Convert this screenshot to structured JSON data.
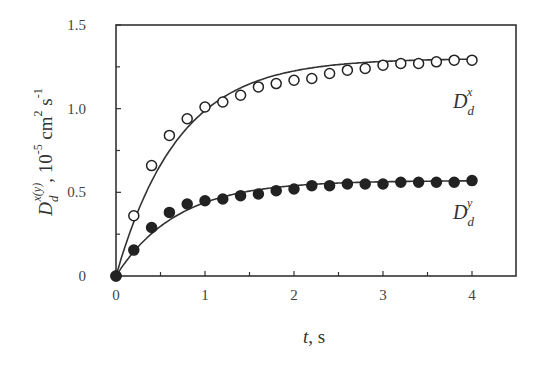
{
  "chart_data": {
    "type": "scatter",
    "title": "",
    "xlabel": "t, s",
    "ylabel": "D_d^{x(y)}, 10^{-5} cm^2 s^{-1}",
    "xlim": [
      0,
      4.5
    ],
    "ylim": [
      0,
      1.5
    ],
    "x_ticks": [
      0,
      1,
      2,
      3,
      4
    ],
    "x_minor_ticks": [
      0.5,
      1.5,
      2.5,
      3.5
    ],
    "y_ticks": [
      0,
      0.5,
      1.0,
      1.5
    ],
    "y_tick_labels": [
      "0",
      "0.5",
      "1.0",
      "1.5"
    ],
    "y_minor_ticks": [
      0.25,
      0.75,
      1.25
    ],
    "grid": false,
    "legend": "inline labels near curve ends",
    "series": [
      {
        "name": "D_d^x",
        "label_main": "D",
        "label_sub": "d",
        "label_sup": "x",
        "marker": "open-circle",
        "x": [
          0,
          0.2,
          0.4,
          0.6,
          0.8,
          1.0,
          1.2,
          1.4,
          1.6,
          1.8,
          2.0,
          2.2,
          2.4,
          2.6,
          2.8,
          3.0,
          3.2,
          3.4,
          3.6,
          3.8,
          4.0
        ],
        "values": [
          0,
          0.36,
          0.66,
          0.84,
          0.94,
          1.01,
          1.04,
          1.08,
          1.13,
          1.15,
          1.17,
          1.18,
          1.21,
          1.23,
          1.24,
          1.26,
          1.27,
          1.27,
          1.28,
          1.29,
          1.29
        ],
        "fit": {
          "form": "A*(1-exp(-t/tau))",
          "A": 1.3,
          "tau": 0.7
        }
      },
      {
        "name": "D_d^y",
        "label_main": "D",
        "label_sub": "d",
        "label_sup": "y",
        "marker": "filled-circle",
        "x": [
          0,
          0.2,
          0.4,
          0.6,
          0.8,
          1.0,
          1.2,
          1.4,
          1.6,
          1.8,
          2.0,
          2.2,
          2.4,
          2.6,
          2.8,
          3.0,
          3.2,
          3.4,
          3.6,
          3.8,
          4.0
        ],
        "values": [
          0,
          0.155,
          0.29,
          0.38,
          0.43,
          0.45,
          0.46,
          0.48,
          0.49,
          0.51,
          0.52,
          0.54,
          0.54,
          0.55,
          0.55,
          0.55,
          0.56,
          0.56,
          0.56,
          0.56,
          0.57
        ],
        "fit": {
          "form": "A*(1-exp(-t/tau))",
          "A": 0.57,
          "tau": 0.68
        }
      }
    ]
  },
  "axis_labels": {
    "x_main": "t",
    "x_unit": ", s",
    "y_main": "D",
    "y_sub": "d",
    "y_sup": "x(y)",
    "y_unit_part1": ", 10",
    "y_unit_exp1": "-5",
    "y_unit_part2": " cm",
    "y_unit_exp2": "2",
    "y_unit_part3": " s",
    "y_unit_exp3": "-1"
  },
  "colors": {
    "axis": "#333333",
    "line": "#333333",
    "marker_fill_open": "#ffffff",
    "marker_fill_filled": "#222222"
  }
}
